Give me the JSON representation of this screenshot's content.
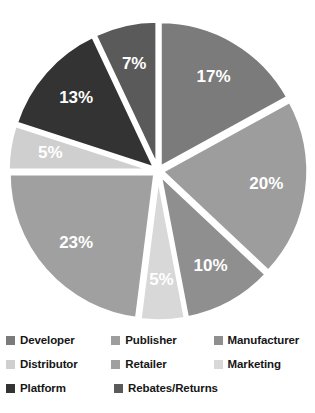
{
  "chart_data": {
    "type": "pie",
    "title": "",
    "subtitle": "",
    "xlabel": "",
    "ylabel": "",
    "legend_position": "bottom",
    "grid": false,
    "value_suffix": "%",
    "start_angle_deg": 0,
    "direction": "clockwise",
    "exploded": true,
    "categories": [
      "Developer",
      "Publisher",
      "Manufacturer",
      "Marketing",
      "Retailer",
      "Distributor",
      "Platform",
      "Rebates/Returns"
    ],
    "values": [
      17,
      20,
      10,
      5,
      23,
      5,
      13,
      7
    ],
    "labels": [
      "17%",
      "20%",
      "10%",
      "5%",
      "23%",
      "5%",
      "13%",
      "7%"
    ],
    "colors": [
      "#7b7b7b",
      "#9d9d9d",
      "#8f8f8f",
      "#d8d8d8",
      "#a0a0a0",
      "#cfcfcf",
      "#333333",
      "#5a5a5a"
    ],
    "slices": [
      {
        "name": "Developer",
        "value": 17,
        "label": "17%",
        "color": "#7b7b7b"
      },
      {
        "name": "Publisher",
        "value": 20,
        "label": "20%",
        "color": "#9d9d9d"
      },
      {
        "name": "Manufacturer",
        "value": 10,
        "label": "10%",
        "color": "#8f8f8f"
      },
      {
        "name": "Marketing",
        "value": 5,
        "label": "5%",
        "color": "#d8d8d8"
      },
      {
        "name": "Retailer",
        "value": 23,
        "label": "23%",
        "color": "#a0a0a0"
      },
      {
        "name": "Distributor",
        "value": 5,
        "label": "5%",
        "color": "#cfcfcf"
      },
      {
        "name": "Platform",
        "value": 13,
        "label": "13%",
        "color": "#333333"
      },
      {
        "name": "Rebates/Returns",
        "value": 7,
        "label": "7%",
        "color": "#5a5a5a"
      }
    ]
  },
  "pie": {
    "center_x": 158,
    "center_y": 171,
    "radius": 146,
    "explode_offset": 4,
    "label_radius_ratio": 0.72,
    "separator_color": "#ffffff",
    "label_color": "#ffffff"
  },
  "legend": {
    "rows": [
      [
        {
          "label": "Developer",
          "color": "#7b7b7b"
        },
        {
          "label": "Publisher",
          "color": "#9d9d9d"
        },
        {
          "label": "Manufacturer",
          "color": "#8f8f8f"
        }
      ],
      [
        {
          "label": "Distributor",
          "color": "#cfcfcf"
        },
        {
          "label": "Retailer",
          "color": "#a0a0a0"
        },
        {
          "label": "Marketing",
          "color": "#d8d8d8"
        }
      ],
      [
        {
          "label": "Platform",
          "color": "#333333"
        },
        {
          "label": "Rebates/Returns",
          "color": "#5a5a5a"
        }
      ]
    ]
  }
}
